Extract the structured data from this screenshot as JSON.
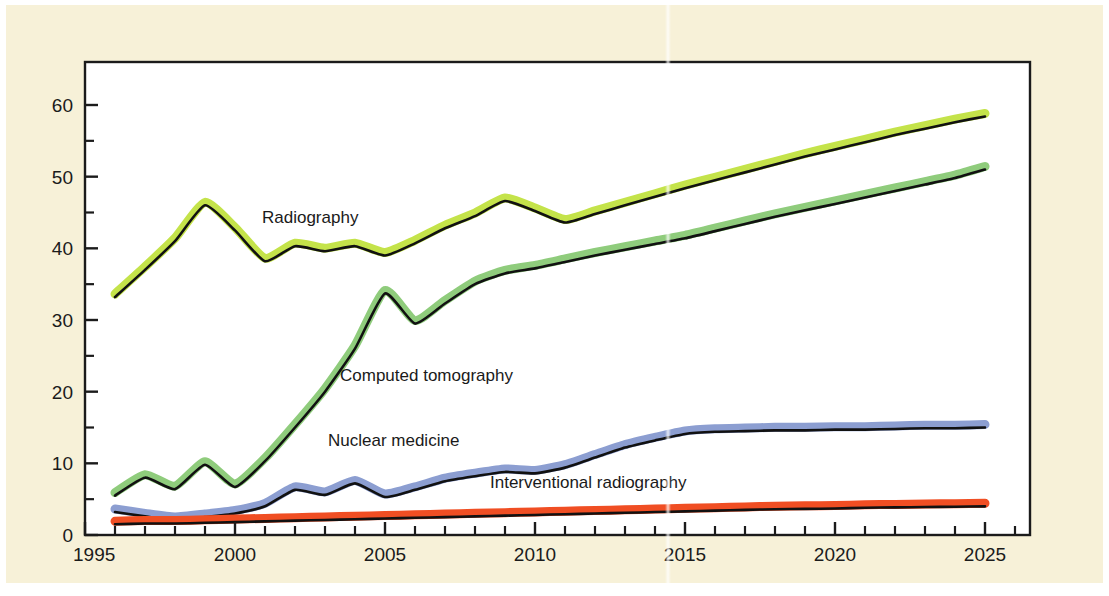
{
  "figure": {
    "background_color": "#f7f1d8",
    "page_color": "#ffffff",
    "plot_area_color": "#ffffff",
    "axis_color": "#1b1b1b"
  },
  "chart_data": {
    "type": "line",
    "title": "",
    "subtitle": "",
    "xlabel": "",
    "ylabel": "",
    "xlim": [
      1995,
      2026.5
    ],
    "ylim": [
      0,
      66
    ],
    "grid": false,
    "legend_position": "inline-labels",
    "x_ticks_major": [
      1995,
      2000,
      2005,
      2010,
      2015,
      2020,
      2025
    ],
    "x_tick_labels": [
      "1995",
      "2000",
      "2005",
      "2010",
      "2015",
      "2020",
      "2025"
    ],
    "x_tick_minor_step": 1,
    "y_ticks_major": [
      0,
      10,
      20,
      30,
      40,
      50,
      60
    ],
    "y_tick_labels": [
      "0",
      "10",
      "20",
      "30",
      "40",
      "50",
      "60"
    ],
    "y_tick_minor_step": 5,
    "x": [
      1996,
      1997,
      1998,
      1999,
      2000,
      2001,
      2002,
      2003,
      2004,
      2005,
      2006,
      2007,
      2008,
      2009,
      2010,
      2011,
      2012,
      2013,
      2014,
      2015,
      2016,
      2017,
      2018,
      2019,
      2020,
      2021,
      2022,
      2023,
      2024,
      2025
    ],
    "series": [
      {
        "name": "Radiography",
        "color": "#c4e34a",
        "outline_color": "#111111",
        "label": "Radiography",
        "values": [
          33.2,
          37.0,
          41.0,
          46.0,
          42.5,
          38.2,
          40.3,
          39.6,
          40.3,
          39.0,
          40.7,
          42.8,
          44.5,
          46.6,
          45.2,
          43.6,
          44.8,
          46.0,
          47.2,
          48.4,
          49.5,
          50.6,
          51.7,
          52.8,
          53.8,
          54.8,
          55.8,
          56.7,
          57.6,
          58.4
        ]
      },
      {
        "name": "Computed tomography",
        "color": "#8fcc7c",
        "outline_color": "#111111",
        "label": "Computed tomography",
        "values": [
          5.5,
          8.0,
          6.4,
          9.8,
          6.7,
          10.3,
          15.0,
          20.0,
          26.0,
          33.7,
          29.5,
          32.3,
          35.0,
          36.5,
          37.2,
          38.1,
          39.0,
          39.8,
          40.6,
          41.4,
          42.4,
          43.4,
          44.4,
          45.3,
          46.2,
          47.1,
          48.0,
          48.9,
          49.8,
          51.0
        ]
      },
      {
        "name": "Nuclear medicine",
        "color": "#8c9ed1",
        "outline_color": "#111111",
        "label": "Nuclear medicine",
        "values": [
          3.2,
          2.6,
          2.1,
          2.5,
          3.0,
          4.0,
          6.3,
          5.6,
          7.2,
          5.3,
          6.3,
          7.5,
          8.2,
          8.8,
          8.6,
          9.4,
          10.8,
          12.2,
          13.2,
          14.1,
          14.4,
          14.5,
          14.6,
          14.6,
          14.7,
          14.7,
          14.8,
          14.9,
          14.9,
          15.0
        ]
      },
      {
        "name": "Interventional radiography",
        "color": "#f04e23",
        "outline_color": "#111111",
        "label": "Interventional radiography",
        "values": [
          1.5,
          1.6,
          1.6,
          1.7,
          1.8,
          1.9,
          2.0,
          2.1,
          2.2,
          2.3,
          2.4,
          2.5,
          2.6,
          2.7,
          2.8,
          2.9,
          3.0,
          3.1,
          3.2,
          3.3,
          3.4,
          3.5,
          3.6,
          3.65,
          3.7,
          3.8,
          3.85,
          3.9,
          3.95,
          4.0
        ]
      }
    ],
    "annotations": [
      {
        "text": "Radiography",
        "x": 2000.9,
        "y": 43.6
      },
      {
        "text": "Computed tomography",
        "x": 2003.5,
        "y": 21.5
      },
      {
        "text": "Nuclear medicine",
        "x": 2003.1,
        "y": 12.4
      },
      {
        "text": "Interventional radiography",
        "x": 2008.5,
        "y": 6.5
      }
    ]
  }
}
